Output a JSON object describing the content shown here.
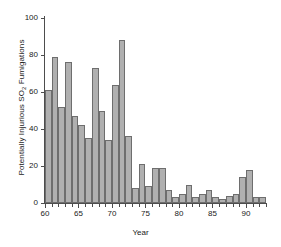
{
  "chart_data": {
    "type": "bar",
    "title": "",
    "xlabel": "Year",
    "ylabel_parts": {
      "pre": "Potentially Injurious SO",
      "sub": "2",
      "post": " Fumigations"
    },
    "ylabel": "Potentially Injurious SO2 Fumigations",
    "xlim": [
      60,
      93
    ],
    "ylim": [
      0,
      100
    ],
    "grid": false,
    "legend": null,
    "bar_color": "#b0b0b0",
    "bar_edge_color": "#6e6e6e",
    "axis_color": "#4d4d4d",
    "text_color": "#1a1a1a",
    "ytick_labels": [
      "0",
      "20",
      "40",
      "60",
      "80",
      "100"
    ],
    "ytick_values": [
      0,
      20,
      40,
      60,
      80,
      100
    ],
    "xtick_labels": [
      "60",
      "65",
      "70",
      "75",
      "80",
      "85",
      "90"
    ],
    "xtick_values": [
      60,
      65,
      70,
      75,
      80,
      85,
      90
    ],
    "categories": [
      60,
      61,
      62,
      63,
      64,
      65,
      66,
      67,
      68,
      69,
      70,
      71,
      72,
      73,
      74,
      75,
      76,
      77,
      78,
      79,
      80,
      81,
      82,
      83,
      84,
      85,
      86,
      87,
      88,
      89,
      90,
      91,
      92
    ],
    "values": [
      61,
      79,
      52,
      76,
      47,
      42,
      35,
      73,
      50,
      34,
      64,
      88,
      36,
      8,
      21,
      9,
      19,
      19,
      7,
      3,
      5,
      10,
      3,
      5,
      7,
      3,
      2,
      4,
      5,
      14,
      18,
      3,
      3
    ]
  }
}
